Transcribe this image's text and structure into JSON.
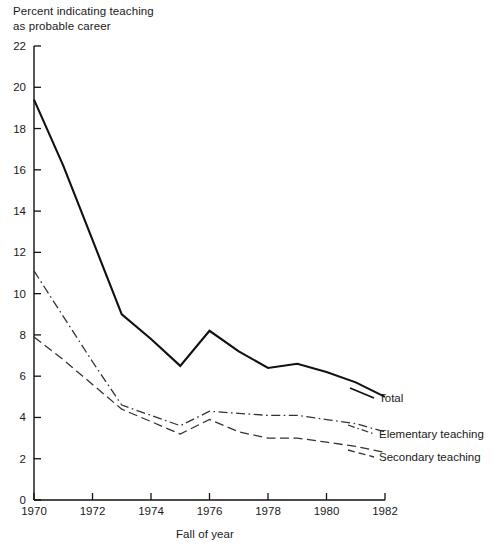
{
  "chart_data": {
    "type": "line",
    "title": "Percent indicating teaching\nas probable career",
    "ylabel": "Percent indicating teaching as probable career",
    "xlabel": "Fall of year",
    "xlim": [
      1970,
      1982
    ],
    "ylim": [
      0,
      22
    ],
    "xticks": [
      "1970",
      "1972",
      "1974",
      "1976",
      "1978",
      "1980",
      "1982"
    ],
    "yticks": [
      "0",
      "2",
      "4",
      "6",
      "8",
      "10",
      "12",
      "14",
      "16",
      "18",
      "20",
      "22"
    ],
    "grid": false,
    "legend_position": "right-inline-labels",
    "x": [
      1970,
      1971,
      1972,
      1973,
      1974,
      1975,
      1976,
      1977,
      1978,
      1979,
      1980,
      1981,
      1982
    ],
    "series": [
      {
        "name": "Total",
        "style": "solid",
        "color": "#111111",
        "values": [
          19.4,
          16.2,
          12.6,
          9.0,
          7.8,
          6.5,
          8.2,
          7.2,
          6.4,
          6.6,
          6.2,
          5.7,
          5.0
        ]
      },
      {
        "name": "Elementary teaching",
        "style": "dash-dot",
        "color": "#333333",
        "values": [
          11.1,
          8.9,
          6.7,
          4.6,
          4.1,
          3.6,
          4.3,
          4.2,
          4.1,
          4.1,
          3.9,
          3.7,
          3.3
        ]
      },
      {
        "name": "Secondary teaching",
        "style": "dashed",
        "color": "#333333",
        "values": [
          7.9,
          6.8,
          5.6,
          4.4,
          3.8,
          3.2,
          3.9,
          3.3,
          3.0,
          3.0,
          2.8,
          2.6,
          2.3
        ]
      }
    ]
  },
  "axis": {
    "ylabel_title": "Percent indicating teaching\nas probable career",
    "xlabel_title": "Fall of year",
    "ytick_labels": [
      "22",
      "20",
      "18",
      "16",
      "14",
      "12",
      "10",
      "8",
      "6",
      "4",
      "2",
      "0"
    ],
    "xtick_labels": [
      "1970",
      "1972",
      "1974",
      "1976",
      "1978",
      "1980",
      "1982"
    ]
  },
  "series_labels": {
    "total": "Total",
    "elementary": "Elementary teaching",
    "secondary": "Secondary teaching"
  }
}
